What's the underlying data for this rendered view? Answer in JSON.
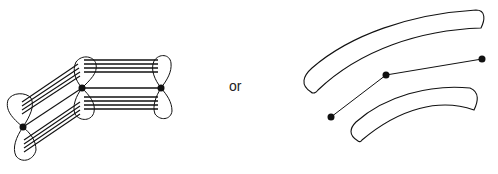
{
  "diagram": {
    "separator_label": "or",
    "left_figure": {
      "description": "three bow-tie lobe pairs connected by bundles of parallel lines",
      "nodes": [
        {
          "id": "n1",
          "x": 23,
          "y": 127
        },
        {
          "id": "n2",
          "x": 82,
          "y": 88
        },
        {
          "id": "n3",
          "x": 161,
          "y": 88
        }
      ]
    },
    "right_figure": {
      "description": "two curved bands with a three-node polyline between them",
      "nodes": [
        {
          "id": "m1",
          "x": 331,
          "y": 117
        },
        {
          "id": "m2",
          "x": 386,
          "y": 75
        },
        {
          "id": "m3",
          "x": 482,
          "y": 59
        }
      ]
    },
    "colors": {
      "stroke": "#111111",
      "background": "#ffffff"
    }
  }
}
